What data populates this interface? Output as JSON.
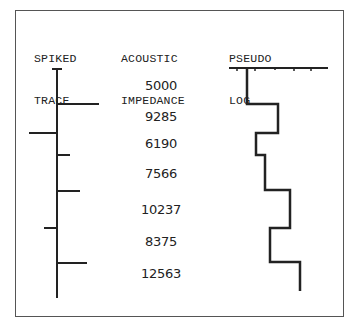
{
  "headers": {
    "spiked_trace": [
      "SPIKED",
      "TRACE"
    ],
    "acoustic_impedance": [
      "ACOUSTIC",
      "IMPEDANCE"
    ],
    "pseudo_log": [
      "PSEUDO",
      "LOG"
    ]
  },
  "impedance_values": [
    "5000",
    "9285",
    "6190",
    "7566",
    "10237",
    "8375",
    "12563"
  ],
  "spikes": [
    {
      "y": 104,
      "x_end": 99
    },
    {
      "y": 133,
      "x_end": 29
    },
    {
      "y": 155,
      "x_end": 70
    },
    {
      "y": 191,
      "x_end": 80
    },
    {
      "y": 228,
      "x_end": 44
    },
    {
      "y": 263,
      "x_end": 87
    }
  ],
  "pseudo_log_steps": [
    {
      "x": 247,
      "y_top": 68,
      "y_bottom": 104
    },
    {
      "x": 278,
      "y_top": 104,
      "y_bottom": 133
    },
    {
      "x": 256,
      "y_top": 133,
      "y_bottom": 155
    },
    {
      "x": 265,
      "y_top": 155,
      "y_bottom": 190
    },
    {
      "x": 290,
      "y_top": 190,
      "y_bottom": 228
    },
    {
      "x": 270,
      "y_top": 228,
      "y_bottom": 262
    },
    {
      "x": 300,
      "y_top": 262,
      "y_bottom": 291
    }
  ]
}
